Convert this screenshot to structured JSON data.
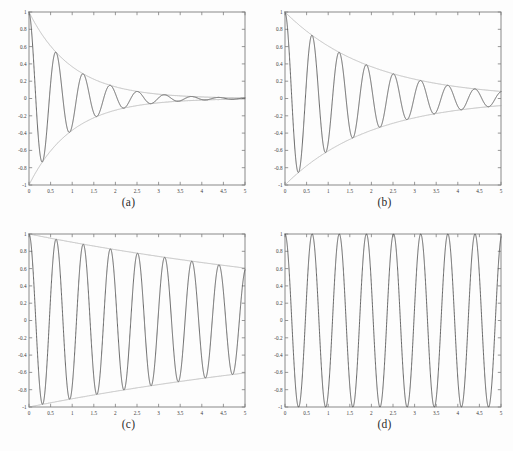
{
  "figure": {
    "background": "#fdfdfd",
    "curve_color": "#4a4a4a",
    "envelope_color": "#9a9a9a",
    "axis_color": "#7d7d7d",
    "text_color": "#2b2b2b"
  },
  "captions": {
    "a": "(a)",
    "b": "(b)",
    "c": "(c)",
    "d": "(d)"
  },
  "axes": {
    "xticks": [
      "0",
      "0.5",
      "1",
      "1.5",
      "2",
      "2.5",
      "3",
      "3.5",
      "4",
      "4.5",
      "5"
    ],
    "xtick_values": [
      0,
      0.5,
      1,
      1.5,
      2,
      2.5,
      3,
      3.5,
      4,
      4.5,
      5
    ],
    "yticks": [
      "1",
      "0.8",
      "0.6",
      "0.4",
      "0.2",
      "0",
      "-0.2",
      "-0.4",
      "-0.6",
      "-0.8",
      "-1"
    ],
    "ytick_values": [
      1,
      0.8,
      0.6,
      0.4,
      0.2,
      0,
      -0.2,
      -0.4,
      -0.6,
      -0.8,
      -1
    ],
    "xlim": [
      0,
      5
    ],
    "ylim": [
      -1,
      1
    ]
  },
  "chart_data": [
    {
      "type": "line",
      "panel": "a",
      "title": "(a)",
      "xlabel": "",
      "ylabel": "",
      "xlim": [
        0,
        5
      ],
      "ylim": [
        -1,
        1
      ],
      "grid": false,
      "legend": null,
      "xticks": [
        0,
        0.5,
        1,
        1.5,
        2,
        2.5,
        3,
        3.5,
        4,
        4.5,
        5
      ],
      "yticks": [
        -1,
        -0.8,
        -0.6,
        -0.4,
        -0.2,
        0,
        0.2,
        0.4,
        0.6,
        0.8,
        1
      ],
      "model": "damped-cosine",
      "decay_rate": 1.0,
      "omega": 10,
      "series": [
        {
          "name": "response",
          "formula": "exp(-1.0*t)*cos(10*t)",
          "color": "#4a4a4a"
        },
        {
          "name": "upper-envelope",
          "formula": "exp(-1.0*t)",
          "color": "#9a9a9a"
        },
        {
          "name": "lower-envelope",
          "formula": "-exp(-1.0*t)",
          "color": "#9a9a9a"
        }
      ],
      "annotations": [
        "starts at 1.0 at t=0",
        "first minimum approx -0.74 at t approx 0.31",
        "amplitude nearly zero by t=5"
      ]
    },
    {
      "type": "line",
      "panel": "b",
      "title": "(b)",
      "xlabel": "",
      "ylabel": "",
      "xlim": [
        0,
        5
      ],
      "ylim": [
        -1,
        1
      ],
      "grid": false,
      "legend": null,
      "xticks": [
        0,
        0.5,
        1,
        1.5,
        2,
        2.5,
        3,
        3.5,
        4,
        4.5,
        5
      ],
      "yticks": [
        -1,
        -0.8,
        -0.6,
        -0.4,
        -0.2,
        0,
        0.2,
        0.4,
        0.6,
        0.8,
        1
      ],
      "model": "damped-cosine",
      "decay_rate": 0.5,
      "omega": 10,
      "series": [
        {
          "name": "response",
          "formula": "exp(-0.5*t)*cos(10*t)",
          "color": "#4a4a4a"
        },
        {
          "name": "upper-envelope",
          "formula": "exp(-0.5*t)",
          "color": "#9a9a9a"
        },
        {
          "name": "lower-envelope",
          "formula": "-exp(-0.5*t)",
          "color": "#9a9a9a"
        }
      ],
      "annotations": [
        "starts at 1.0 at t=0",
        "envelope approx 0.08 at t=5"
      ]
    },
    {
      "type": "line",
      "panel": "c",
      "title": "(c)",
      "xlabel": "",
      "ylabel": "",
      "xlim": [
        0,
        5
      ],
      "ylim": [
        -1,
        1
      ],
      "grid": false,
      "legend": null,
      "xticks": [
        0,
        0.5,
        1,
        1.5,
        2,
        2.5,
        3,
        3.5,
        4,
        4.5,
        5
      ],
      "yticks": [
        -1,
        -0.8,
        -0.6,
        -0.4,
        -0.2,
        0,
        0.2,
        0.4,
        0.6,
        0.8,
        1
      ],
      "model": "damped-cosine",
      "decay_rate": 0.1,
      "omega": 10,
      "series": [
        {
          "name": "response",
          "formula": "exp(-0.1*t)*cos(10*t)",
          "color": "#4a4a4a"
        },
        {
          "name": "upper-envelope",
          "formula": "exp(-0.1*t)",
          "color": "#9a9a9a"
        },
        {
          "name": "lower-envelope",
          "formula": "-exp(-0.1*t)",
          "color": "#9a9a9a"
        }
      ],
      "annotations": [
        "envelope approx 0.61 at t=5",
        "nearly straight-line envelope"
      ]
    },
    {
      "type": "line",
      "panel": "d",
      "title": "(d)",
      "xlabel": "",
      "ylabel": "",
      "xlim": [
        0,
        5
      ],
      "ylim": [
        -1,
        1
      ],
      "grid": false,
      "legend": null,
      "xticks": [
        0,
        0.5,
        1,
        1.5,
        2,
        2.5,
        3,
        3.5,
        4,
        4.5,
        5
      ],
      "yticks": [
        -1,
        -0.8,
        -0.6,
        -0.4,
        -0.2,
        0,
        0.2,
        0.4,
        0.6,
        0.8,
        1
      ],
      "model": "undamped-cosine",
      "decay_rate": 0.0,
      "omega": 10,
      "series": [
        {
          "name": "response",
          "formula": "cos(10*t)",
          "color": "#4a4a4a"
        }
      ],
      "annotations": [
        "constant amplitude 1.0",
        "no envelope drawn"
      ]
    }
  ]
}
